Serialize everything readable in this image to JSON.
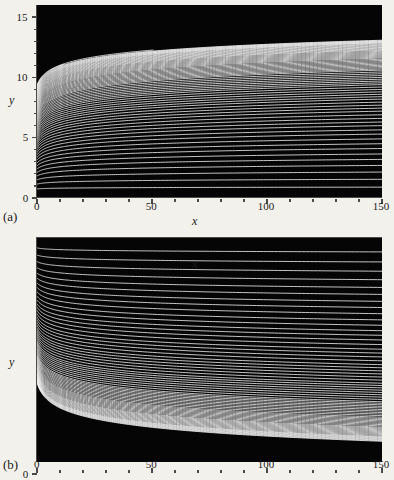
{
  "figure": {
    "background_color": "#f3f1ec",
    "plot_background_color": "#050505",
    "curve_color": "#f2f2f2",
    "axis_color": "#4a4a4a",
    "width": 394,
    "height": 480
  },
  "panels": [
    {
      "key": "a",
      "label": "(a)",
      "xlabel": "x",
      "ylabel": "y",
      "xticklabels": [
        "0",
        "50",
        "100",
        "150"
      ],
      "yticklabels": [
        "0",
        "5",
        "10",
        "15"
      ]
    },
    {
      "key": "b",
      "label": "(b)",
      "xlabel": "x",
      "ylabel": "y",
      "xticklabels": [
        "0",
        "50",
        "100",
        "150"
      ],
      "yticklabels": [
        "0",
        "−5",
        "−10"
      ]
    }
  ],
  "chart_data": [
    {
      "type": "line",
      "panel": "(a)",
      "title": "",
      "xlabel": "x",
      "ylabel": "y",
      "xlim": [
        0,
        150
      ],
      "ylim": [
        0,
        16
      ],
      "xticks": [
        0,
        50,
        100,
        150
      ],
      "yticks": [
        0,
        5,
        10,
        15
      ],
      "xminorticks": [
        10,
        20,
        30,
        40,
        60,
        70,
        80,
        90,
        110,
        120,
        130,
        140
      ],
      "yminorticks": [
        1,
        2,
        3,
        4,
        6,
        7,
        8,
        9,
        11,
        12,
        13,
        14
      ],
      "grid": false,
      "legend": null,
      "background": "#050505",
      "line_color": "#f2f2f2",
      "description": "Family of about 70 white level curves on a black field. Each curve rises very steeply from near y=0 at x=0, turns over within x<5, then increases slowly and almost linearly toward the right edge. Curve spacing is wide near the bottom and compresses toward the top, so the density of curves grows with y and the panel appears black above y~13.",
      "n_curves": 70,
      "curve_endpoints_x150": [
        0.9,
        1.55,
        2.15,
        2.7,
        3.2,
        3.65,
        4.1,
        4.5,
        4.9,
        5.3,
        5.65,
        6.0,
        6.3,
        6.6,
        6.9,
        7.2,
        7.45,
        7.7,
        7.95,
        8.2,
        8.4,
        8.6,
        8.8,
        9.0,
        9.2,
        9.4,
        9.55,
        9.7,
        9.85,
        10.0,
        10.15,
        10.3,
        10.45,
        10.6,
        10.7,
        10.8,
        10.9,
        11.0,
        11.1,
        11.2,
        11.3,
        11.4,
        11.5,
        11.6,
        11.68,
        11.76,
        11.84,
        11.92,
        12.0,
        12.08,
        12.16,
        12.24,
        12.3,
        12.36,
        12.42,
        12.48,
        12.54,
        12.6,
        12.66,
        12.72,
        12.78,
        12.84,
        12.88,
        12.92,
        12.96,
        13.0,
        13.04,
        13.08,
        13.12,
        13.16
      ],
      "curve_start_y_at_x0": [
        0.75,
        1.15,
        1.5,
        1.82,
        2.12,
        2.4,
        2.66,
        2.9,
        3.14,
        3.36,
        3.57,
        3.77,
        3.96,
        4.15,
        4.32,
        4.5,
        4.66,
        4.82,
        4.97,
        5.12,
        5.26,
        5.4,
        5.53,
        5.66,
        5.79,
        5.91,
        6.03,
        6.15,
        6.26,
        6.37,
        6.48,
        6.58,
        6.69,
        6.79,
        6.88,
        6.98,
        7.07,
        7.17,
        7.26,
        7.34,
        7.43,
        7.51,
        7.6,
        7.68,
        7.76,
        7.84,
        7.91,
        7.99,
        8.06,
        8.13,
        8.2,
        8.27,
        8.34,
        8.41,
        8.48,
        8.54,
        8.61,
        8.67,
        8.73,
        8.79,
        8.85,
        8.91,
        8.97,
        9.03,
        9.09,
        9.14,
        9.2,
        9.25,
        9.31,
        9.36
      ],
      "notes": "The uppermost visible curve terminates near x=55 rather than spanning the full width; a second partial curve ends near x=12."
    },
    {
      "type": "line",
      "panel": "(b)",
      "title": "",
      "xlabel": "x",
      "ylabel": "y",
      "xlim": [
        0,
        150
      ],
      "ylim": [
        -14.5,
        0
      ],
      "xticks": [
        0,
        50,
        100,
        150
      ],
      "yticks": [
        0,
        -5,
        -10
      ],
      "xminorticks": [
        10,
        20,
        30,
        40,
        60,
        70,
        80,
        90,
        110,
        120,
        130,
        140
      ],
      "yminorticks": [
        -1,
        -2,
        -3,
        -4,
        -6,
        -7,
        -8,
        -9,
        -11,
        -12,
        -13,
        -14
      ],
      "grid": false,
      "legend": null,
      "background": "#050505",
      "line_color": "#f2f2f2",
      "description": "Mirror image of panel (a). About 70 white curves fall very steeply from near y=0 at x=0, turn within x<5, then descend slowly toward the right edge. Spacing is wide near the top and compresses toward the bottom, so the field darkens below y=-13. The x axis with its tick labels sits along the top of this panel.",
      "n_curves": 70,
      "curve_endpoints_x150": [
        -0.9,
        -1.55,
        -2.15,
        -2.7,
        -3.2,
        -3.65,
        -4.1,
        -4.5,
        -4.9,
        -5.3,
        -5.65,
        -6.0,
        -6.3,
        -6.6,
        -6.9,
        -7.2,
        -7.45,
        -7.7,
        -7.95,
        -8.2,
        -8.4,
        -8.6,
        -8.8,
        -9.0,
        -9.2,
        -9.4,
        -9.55,
        -9.7,
        -9.85,
        -10.0,
        -10.15,
        -10.3,
        -10.45,
        -10.6,
        -10.7,
        -10.8,
        -10.9,
        -11.0,
        -11.1,
        -11.2,
        -11.3,
        -11.4,
        -11.5,
        -11.6,
        -11.68,
        -11.76,
        -11.84,
        -11.92,
        -12.0,
        -12.08,
        -12.16,
        -12.24,
        -12.3,
        -12.36,
        -12.42,
        -12.48,
        -12.54,
        -12.6,
        -12.66,
        -12.72,
        -12.78,
        -12.84,
        -12.88,
        -12.92,
        -12.96,
        -13.0,
        -13.04,
        -13.08,
        -13.12,
        -13.16
      ]
    }
  ]
}
